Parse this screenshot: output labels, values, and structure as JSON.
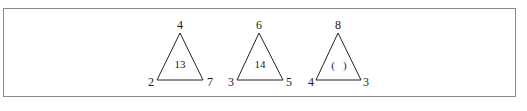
{
  "diagram": {
    "border_color": "#8a8a8a",
    "line_color": "#222222",
    "triangles": [
      {
        "top": "4",
        "bottom_left": "2",
        "bottom_right": "7",
        "center": "13"
      },
      {
        "top": "6",
        "bottom_left": "3",
        "bottom_right": "5",
        "center": "14"
      },
      {
        "top": "8",
        "bottom_left": "4",
        "bottom_right": "3",
        "center": "(   )"
      }
    ]
  }
}
